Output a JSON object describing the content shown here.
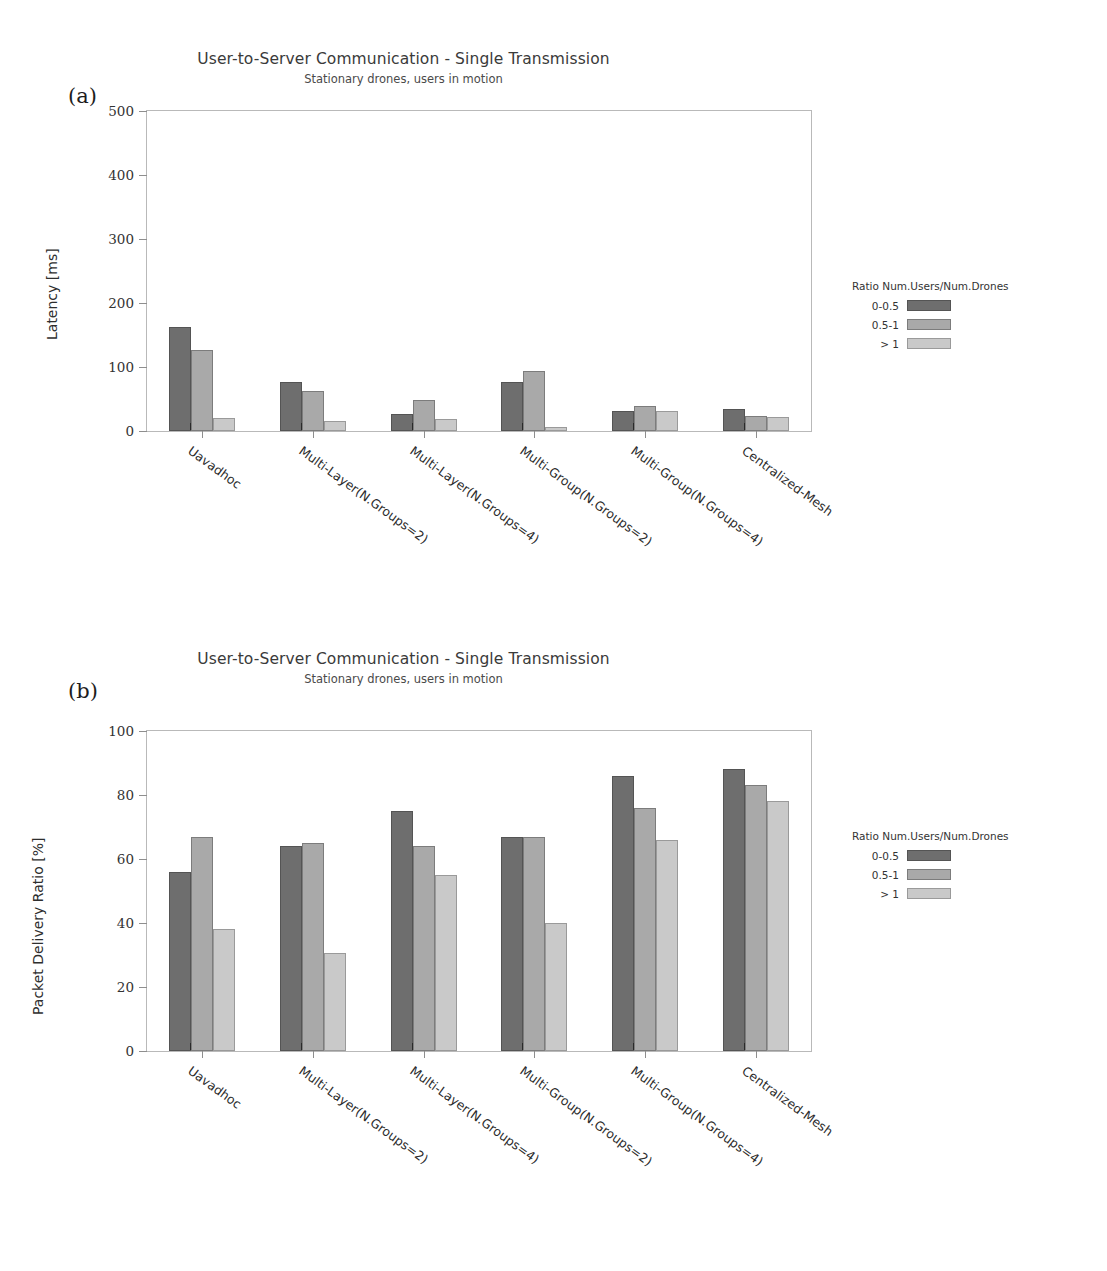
{
  "page_header": {
    "left_text": "",
    "right_text": ""
  },
  "figures": [
    {
      "panel_label": "(a)",
      "title": "User-to-Server Communication - Single Transmission",
      "subtitle": "Stationary drones, users in motion",
      "legend_title": "Ratio Num.Users/Num.Drones",
      "legend_entries": [
        "0-0.5",
        "0.5-1",
        "> 1"
      ]
    },
    {
      "panel_label": "(b)",
      "title": "User-to-Server Communication - Single Transmission",
      "subtitle": "Stationary drones, users in motion",
      "legend_title": "Ratio Num.Users/Num.Drones",
      "legend_entries": [
        "0-0.5",
        "0.5-1",
        "> 1"
      ]
    }
  ],
  "colors": {
    "series_0": "#6e6e6e",
    "series_1": "#a9a9a9",
    "series_2": "#c9c9c9",
    "axis": "#b9b9b9",
    "text": "#2b2b2b"
  },
  "chart_data": [
    {
      "type": "bar",
      "panel": "(a)",
      "title": "User-to-Server Communication - Single Transmission",
      "subtitle": "Stationary drones, users in motion",
      "xlabel": "",
      "ylabel": "Latency [ms]",
      "ylim": [
        0,
        500
      ],
      "yticks": [
        0,
        100,
        200,
        300,
        400,
        500
      ],
      "ytick_labels": [
        "0",
        "100",
        "200",
        "300",
        "400",
        "500"
      ],
      "grid": false,
      "legend_title": "Ratio Num.Users/Num.Drones",
      "legend_position": "right",
      "categories": [
        "Uavadhoc",
        "Multi-Layer(N.Groups=2)",
        "Multi-Layer(N.Groups=4)",
        "Multi-Group(N.Groups=2)",
        "Multi-Group(N.Groups=4)",
        "Centralized-Mesh"
      ],
      "series": [
        {
          "name": "0-0.5",
          "values": [
            162,
            76,
            27,
            76,
            32,
            35
          ]
        },
        {
          "name": "0.5-1",
          "values": [
            127,
            62,
            49,
            93,
            39,
            23
          ]
        },
        {
          "name": "> 1",
          "values": [
            21,
            15,
            18,
            6,
            32,
            22
          ]
        }
      ]
    },
    {
      "type": "bar",
      "panel": "(b)",
      "title": "User-to-Server Communication - Single Transmission",
      "subtitle": "Stationary drones, users in motion",
      "xlabel": "",
      "ylabel": "Packet Delivery Ratio [%]",
      "ylim": [
        0,
        100
      ],
      "yticks": [
        0,
        20,
        40,
        60,
        80,
        100
      ],
      "ytick_labels": [
        "0",
        "20",
        "40",
        "60",
        "80",
        "100"
      ],
      "grid": false,
      "legend_title": "Ratio Num.Users/Num.Drones",
      "legend_position": "right",
      "categories": [
        "Uavadhoc",
        "Multi-Layer(N.Groups=2)",
        "Multi-Layer(N.Groups=4)",
        "Multi-Group(N.Groups=2)",
        "Multi-Group(N.Groups=4)",
        "Centralized-Mesh"
      ],
      "series": [
        {
          "name": "0-0.5",
          "values": [
            56,
            64,
            75,
            67,
            86,
            88
          ]
        },
        {
          "name": "0.5-1",
          "values": [
            67,
            65,
            64,
            67,
            76,
            83
          ]
        },
        {
          "name": "> 1",
          "values": [
            38,
            30.5,
            55,
            40,
            66,
            78
          ]
        }
      ]
    }
  ]
}
